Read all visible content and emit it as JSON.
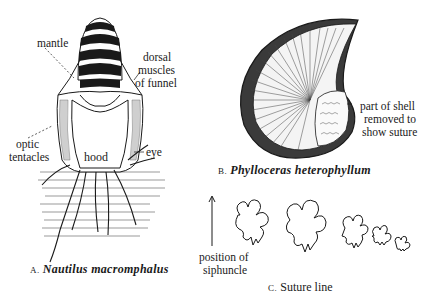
{
  "figure_a": {
    "caption_letter": "A.",
    "caption_name": "Nautilus macromphalus",
    "labels": {
      "mantle": "mantle",
      "dorsal_1": "dorsal",
      "dorsal_2": "muscles",
      "dorsal_3": "of funnel",
      "optic_1": "optic",
      "optic_2": "tentacles",
      "hood": "hood",
      "eye": "eye"
    }
  },
  "figure_b": {
    "caption_letter": "B.",
    "caption_name": "Phylloceras heterophyllum",
    "labels": {
      "part_1": "part of shell",
      "part_2": "removed to",
      "part_3": "show suture"
    }
  },
  "figure_c": {
    "caption_letter": "C.",
    "caption_name": "Suture line",
    "labels": {
      "pos_1": "position of",
      "pos_2": "siphuncle"
    }
  },
  "colors": {
    "ink": "#1a1a1a",
    "paper": "#ffffff",
    "stipple": "#9a9a9a"
  }
}
